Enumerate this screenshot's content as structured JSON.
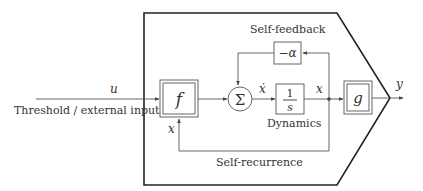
{
  "diagram": {
    "input_symbol": "u",
    "input_label": "Threshold / external inputs",
    "f_block": "f",
    "sum_symbol": "Σ",
    "xdot_symbol": "ẋ",
    "integrator": {
      "numerator": "1",
      "denominator": "s"
    },
    "dynamics_label": "Dynamics",
    "feedback_label": "Self-feedback",
    "feedback_gain": "−α",
    "state_symbol": "x",
    "recurrence_state_symbol": "x",
    "g_block": "g",
    "output_symbol": "y",
    "recurrence_label": "Self-recurrence"
  }
}
